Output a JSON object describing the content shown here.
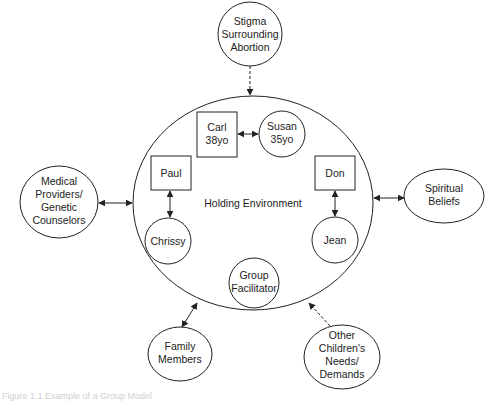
{
  "diagram": {
    "holding_environment": {
      "label": "Holding Environment"
    },
    "inner_nodes": {
      "carl": {
        "line1": "Carl",
        "line2": "38yo",
        "shape": "square"
      },
      "susan": {
        "line1": "Susan",
        "line2": "35yo",
        "shape": "circle"
      },
      "paul": {
        "line1": "Paul",
        "shape": "square"
      },
      "chrissy": {
        "line1": "Chrissy",
        "shape": "circle"
      },
      "don": {
        "line1": "Don",
        "shape": "square"
      },
      "jean": {
        "line1": "Jean",
        "shape": "circle"
      },
      "facilitator": {
        "line1": "Group",
        "line2": "Facilitator",
        "shape": "circle"
      }
    },
    "outer_nodes": {
      "stigma": {
        "line1": "Stigma",
        "line2": "Surrounding",
        "line3": "Abortion",
        "connection": "dashed one-way inward"
      },
      "medical": {
        "line1": "Medical",
        "line2": "Providers/",
        "line3": "Genetic",
        "line4": "Counselors",
        "connection": "two-way"
      },
      "spiritual": {
        "line1": "Spiritual",
        "line2": "Beliefs",
        "connection": "two-way"
      },
      "family": {
        "line1": "Family",
        "line2": "Members",
        "connection": "two-way"
      },
      "other_children": {
        "line1": "Other",
        "line2": "Children's",
        "line3": "Needs/",
        "line4": "Demands",
        "connection": "dashed one-way inward"
      }
    },
    "inner_links": [
      {
        "from": "Carl",
        "to": "Susan",
        "type": "two-way"
      },
      {
        "from": "Paul",
        "to": "Chrissy",
        "type": "two-way"
      },
      {
        "from": "Don",
        "to": "Jean",
        "type": "two-way"
      }
    ],
    "stroke_color": "#222222",
    "background_color": "#ffffff"
  },
  "caption": {
    "text": "Figure 1.1  Example of a Group Model"
  }
}
